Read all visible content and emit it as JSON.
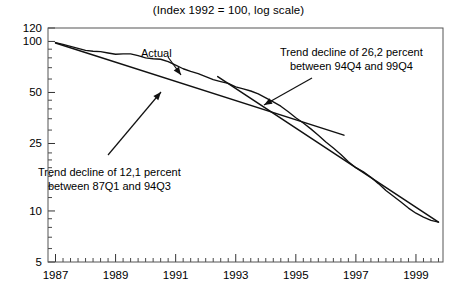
{
  "chart_data": {
    "type": "line",
    "title": "(Index 1992 = 100, log scale)",
    "xlabel": "",
    "ylabel": "",
    "log_scale": true,
    "grid": false,
    "legend_position": "none",
    "xlim": [
      1986.75,
      1999.9
    ],
    "ylim": [
      5,
      120
    ],
    "ytick_labels": [
      "120",
      "100",
      "50",
      "25",
      "10",
      "5"
    ],
    "ytick_values": [
      120,
      100,
      50,
      25,
      10,
      5
    ],
    "ytick_minor": [
      90,
      80,
      70,
      60,
      45,
      40,
      35,
      30,
      22,
      20,
      18,
      16,
      14,
      12,
      9,
      8,
      7,
      6
    ],
    "xtick_labels": [
      "1987",
      "1989",
      "1991",
      "1993",
      "1995",
      "1997",
      "1999"
    ],
    "xtick_values": [
      1987,
      1989,
      1991,
      1993,
      1995,
      1997,
      1999
    ],
    "xtick_minor_step_quarters": 1,
    "series": [
      {
        "name": "Actual",
        "x": [
          1987.0,
          1987.25,
          1987.5,
          1987.75,
          1988.0,
          1988.25,
          1988.5,
          1988.75,
          1989.0,
          1989.25,
          1989.5,
          1989.75,
          1990.0,
          1990.25,
          1990.5,
          1990.75,
          1991.0,
          1991.25,
          1991.5,
          1991.75,
          1992.0,
          1992.25,
          1992.5,
          1992.75,
          1993.0,
          1993.25,
          1993.5,
          1993.75,
          1994.0,
          1994.25,
          1994.5,
          1994.75,
          1995.0,
          1995.25,
          1995.5,
          1995.75,
          1996.0,
          1996.25,
          1996.5,
          1996.75,
          1997.0,
          1997.25,
          1997.5,
          1997.75,
          1998.0,
          1998.25,
          1998.5,
          1998.75,
          1999.0,
          1999.25,
          1999.5,
          1999.75
        ],
        "y": [
          98.5,
          96.0,
          93.5,
          91.0,
          88.5,
          87.5,
          87.0,
          85.5,
          84.0,
          84.5,
          84.5,
          82.5,
          80.0,
          79.0,
          78.5,
          76.0,
          72.5,
          69.0,
          66.5,
          64.5,
          62.0,
          59.5,
          58.0,
          56.5,
          54.0,
          52.5,
          51.0,
          49.0,
          46.5,
          44.0,
          41.5,
          38.5,
          35.5,
          33.0,
          30.5,
          28.0,
          25.5,
          23.5,
          21.5,
          19.5,
          18.0,
          17.0,
          15.8,
          14.5,
          13.2,
          12.2,
          11.3,
          10.4,
          9.7,
          9.2,
          8.8,
          8.6
        ]
      }
    ],
    "trends": [
      {
        "name": "trend-1987-1994",
        "label": "Trend decline of 12,1 percent between 87Q1 and 94Q3",
        "decline_percent": "12,1",
        "from": "87Q1",
        "to": "94Q3",
        "x_start": 1987.0,
        "y_start": 98.0,
        "x_end": 1996.6,
        "y_end": 28.0
      },
      {
        "name": "trend-1994-1999",
        "label": "Trend decline of 26,2 percent between 94Q4 and 99Q4",
        "decline_percent": "26,2",
        "from": "94Q4",
        "to": "99Q4",
        "x_start": 1992.4,
        "y_start": 62.0,
        "x_end": 1999.75,
        "y_end": 8.6
      }
    ],
    "annotations": [
      {
        "name": "actual-label",
        "text": "Actual",
        "x_px": 141,
        "y_px": 47,
        "arrow": {
          "x1": 168,
          "y1": 57,
          "x2": 181,
          "y2": 75
        }
      },
      {
        "name": "trend-26-annotation",
        "lines": [
          "Trend decline of 26,2 percent",
          "between 94Q4 and 99Q4"
        ],
        "x_px": 280,
        "y_px": 45,
        "arrow": {
          "x1": 312,
          "y1": 78,
          "x2": 264,
          "y2": 105
        }
      },
      {
        "name": "trend-12-annotation",
        "lines": [
          "Trend decline of 12,1 percent",
          "between 87Q1 and 94Q3"
        ],
        "x_px": 38,
        "y_px": 165,
        "arrow": {
          "x1": 108,
          "y1": 155,
          "x2": 161,
          "y2": 92
        }
      }
    ]
  },
  "colors": {
    "line": "#111111",
    "frame": "#555555",
    "background": "#ffffff",
    "text": "#000000"
  }
}
